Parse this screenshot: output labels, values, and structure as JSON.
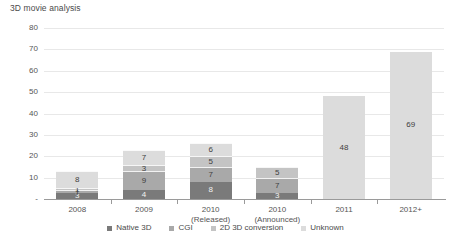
{
  "chart_data": {
    "type": "bar",
    "title": "3D movie analysis",
    "xlabel": "",
    "ylabel": "",
    "ylim": [
      0,
      80
    ],
    "yticks": [
      "-",
      "10",
      "20",
      "30",
      "40",
      "50",
      "60",
      "70",
      "80"
    ],
    "grid": true,
    "stacked": true,
    "legend_position": "bottom",
    "categories": [
      "2008",
      "2009",
      "2010\n(Released)",
      "2010\n(Announced)",
      "2011",
      "2012+"
    ],
    "category_lines": [
      [
        "2008",
        ""
      ],
      [
        "2009",
        ""
      ],
      [
        "2010",
        "(Released)"
      ],
      [
        "2010",
        "(Announced)"
      ],
      [
        "2011",
        ""
      ],
      [
        "2012+",
        ""
      ]
    ],
    "series": [
      {
        "name": "Native 3D",
        "color": "#7a7a7a",
        "values": [
          3,
          4,
          8,
          3,
          0,
          0
        ]
      },
      {
        "name": "CGI",
        "color": "#a9a9a9",
        "values": [
          1,
          9,
          7,
          7,
          0,
          0
        ]
      },
      {
        "name": "2D 3D conversion",
        "color": "#c4c4c4",
        "values": [
          1,
          3,
          5,
          5,
          0,
          0
        ]
      },
      {
        "name": "Unknown",
        "color": "#dcdcdc",
        "values": [
          8,
          7,
          6,
          0,
          48,
          69
        ]
      }
    ],
    "totals": [
      13,
      23,
      26,
      15,
      48,
      69
    ],
    "annotations": [
      {
        "category": "2008",
        "series": "Unknown",
        "value": 8
      },
      {
        "category": "2008",
        "series": "2D 3D conversion",
        "value": 1
      },
      {
        "category": "2008",
        "series": "CGI",
        "value": 1
      },
      {
        "category": "2008",
        "series": "Native 3D",
        "value": 3
      },
      {
        "category": "2009",
        "series": "Unknown",
        "value": 7
      },
      {
        "category": "2009",
        "series": "2D 3D conversion",
        "value": 3
      },
      {
        "category": "2009",
        "series": "CGI",
        "value": 9
      },
      {
        "category": "2009",
        "series": "Native 3D",
        "value": 4
      },
      {
        "category": "2010 (Released)",
        "series": "Unknown",
        "value": 6
      },
      {
        "category": "2010 (Released)",
        "series": "2D 3D conversion",
        "value": 5
      },
      {
        "category": "2010 (Released)",
        "series": "CGI",
        "value": 7
      },
      {
        "category": "2010 (Released)",
        "series": "Native 3D",
        "value": 8
      },
      {
        "category": "2010 (Announced)",
        "series": "2D 3D conversion",
        "value": 5
      },
      {
        "category": "2010 (Announced)",
        "series": "CGI",
        "value": 7
      },
      {
        "category": "2010 (Announced)",
        "series": "Native 3D",
        "value": 3
      },
      {
        "category": "2011",
        "series": "Unknown",
        "value": 48
      },
      {
        "category": "2012+",
        "series": "Unknown",
        "value": 69
      }
    ]
  },
  "colors": {
    "gridline": "#e8e8e8",
    "axis": "#9a9a9a",
    "text": "#555555",
    "title_text": "#4a4a4a",
    "background": "#ffffff"
  },
  "legend": {
    "items": [
      {
        "label": "Native 3D",
        "color": "#7a7a7a"
      },
      {
        "label": "CGI",
        "color": "#a9a9a9"
      },
      {
        "label": "2D 3D conversion",
        "color": "#c4c4c4"
      },
      {
        "label": "Unknown",
        "color": "#dcdcdc"
      }
    ]
  }
}
